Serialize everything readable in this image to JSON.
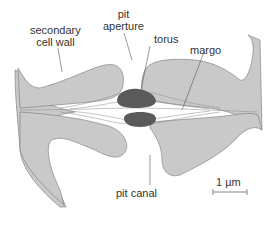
{
  "labels": {
    "secondary_cell_wall": [
      "secondary",
      "cell wall"
    ],
    "pit_aperture": [
      "pit",
      "aperture"
    ],
    "torus": "torus",
    "margo": "margo",
    "pit_canal": "pit canal"
  },
  "scale_bar": {
    "label": "1 µm"
  },
  "colors": {
    "wall": "#c9c9c9",
    "torus": "#5a5a5a",
    "outline": "#777777",
    "background": "#ffffff"
  }
}
